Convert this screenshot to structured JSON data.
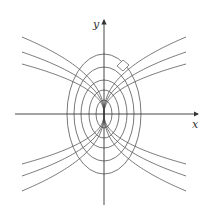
{
  "diagram": {
    "axes": {
      "x_label": "x",
      "y_label": "y"
    },
    "colors": {
      "curve": "#555555",
      "axis": "#333333",
      "background": "#ffffff"
    },
    "origin_px": [
      104,
      114
    ],
    "ellipses": [
      {
        "rx": 8,
        "ry": 14
      },
      {
        "rx": 15,
        "ry": 24
      },
      {
        "rx": 23,
        "ry": 34
      },
      {
        "rx": 30,
        "ry": 47
      },
      {
        "rx": 37,
        "ry": 60
      }
    ],
    "trajectories": {
      "count_per_quadrant": 3,
      "exponent": 0.45,
      "end_offsets_px": [
        50,
        62,
        77
      ],
      "x_extent_px": 82
    },
    "right_angle_marker": {
      "present": true
    }
  }
}
